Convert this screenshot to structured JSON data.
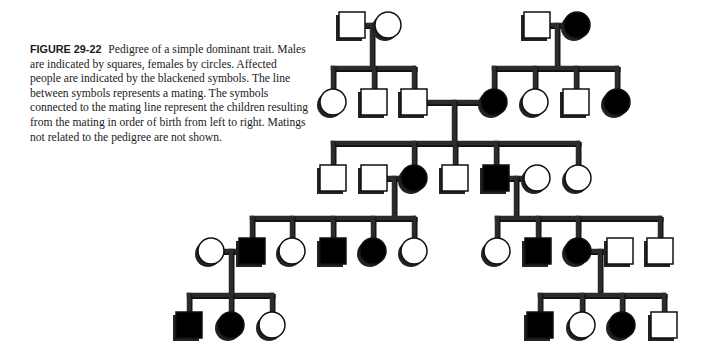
{
  "caption": {
    "label": "FIGURE 29-22",
    "text": "Pedigree of a simple dominant trait. Males are indicated by squares, females by circles. Affected people are indicated by the blackened symbols. The line between symbols represents a mating. The symbols connected to the mating line represent the children resulting from the mating in order of birth from left to right. Matings not related to the pedigree are not shown."
  },
  "legend_semantics": {
    "male": "square",
    "female": "circle",
    "affected": "filled black",
    "unaffected": "open white"
  },
  "colors": {
    "line": "#2b2b2b",
    "affected_fill": "#000000",
    "unaffected_fill": "#ffffff",
    "shadow": "#222222"
  },
  "pedigree": {
    "individuals": [
      {
        "id": "I1",
        "sex": "male",
        "affected": false,
        "x": 352,
        "y": 25
      },
      {
        "id": "I2",
        "sex": "female",
        "affected": false,
        "x": 388,
        "y": 25
      },
      {
        "id": "I3",
        "sex": "male",
        "affected": false,
        "x": 537,
        "y": 25
      },
      {
        "id": "I4",
        "sex": "female",
        "affected": true,
        "x": 577,
        "y": 25
      },
      {
        "id": "II1",
        "sex": "female",
        "affected": false,
        "x": 333,
        "y": 102
      },
      {
        "id": "II2",
        "sex": "male",
        "affected": false,
        "x": 374,
        "y": 102
      },
      {
        "id": "II3",
        "sex": "male",
        "affected": false,
        "x": 414,
        "y": 102
      },
      {
        "id": "II4",
        "sex": "female",
        "affected": true,
        "x": 494,
        "y": 102
      },
      {
        "id": "II5",
        "sex": "female",
        "affected": false,
        "x": 535,
        "y": 102
      },
      {
        "id": "II6",
        "sex": "male",
        "affected": false,
        "x": 576,
        "y": 102
      },
      {
        "id": "II7",
        "sex": "female",
        "affected": true,
        "x": 617,
        "y": 102
      },
      {
        "id": "III1",
        "sex": "male",
        "affected": false,
        "x": 333,
        "y": 178
      },
      {
        "id": "III2s",
        "sex": "male",
        "affected": false,
        "x": 374,
        "y": 178
      },
      {
        "id": "III2",
        "sex": "female",
        "affected": true,
        "x": 414,
        "y": 178
      },
      {
        "id": "III3",
        "sex": "male",
        "affected": false,
        "x": 455,
        "y": 178
      },
      {
        "id": "III4",
        "sex": "male",
        "affected": true,
        "x": 496,
        "y": 178
      },
      {
        "id": "III4s",
        "sex": "female",
        "affected": false,
        "x": 537,
        "y": 178
      },
      {
        "id": "III5",
        "sex": "female",
        "affected": false,
        "x": 578,
        "y": 178
      },
      {
        "id": "IV0s",
        "sex": "female",
        "affected": false,
        "x": 211,
        "y": 251
      },
      {
        "id": "IV1",
        "sex": "male",
        "affected": true,
        "x": 252,
        "y": 251
      },
      {
        "id": "IV2",
        "sex": "female",
        "affected": false,
        "x": 292,
        "y": 251
      },
      {
        "id": "IV3",
        "sex": "male",
        "affected": true,
        "x": 333,
        "y": 251
      },
      {
        "id": "IV4",
        "sex": "female",
        "affected": true,
        "x": 373,
        "y": 251
      },
      {
        "id": "IV5",
        "sex": "female",
        "affected": false,
        "x": 414,
        "y": 251
      },
      {
        "id": "IV6",
        "sex": "female",
        "affected": false,
        "x": 497,
        "y": 251
      },
      {
        "id": "IV7",
        "sex": "male",
        "affected": true,
        "x": 538,
        "y": 251
      },
      {
        "id": "IV8",
        "sex": "female",
        "affected": true,
        "x": 578,
        "y": 251
      },
      {
        "id": "IV8s",
        "sex": "male",
        "affected": false,
        "x": 620,
        "y": 251
      },
      {
        "id": "IV9",
        "sex": "male",
        "affected": false,
        "x": 660,
        "y": 251
      },
      {
        "id": "V1",
        "sex": "male",
        "affected": true,
        "x": 189,
        "y": 325
      },
      {
        "id": "V2",
        "sex": "female",
        "affected": true,
        "x": 231,
        "y": 325
      },
      {
        "id": "V3",
        "sex": "female",
        "affected": false,
        "x": 272,
        "y": 325
      },
      {
        "id": "V4",
        "sex": "male",
        "affected": true,
        "x": 540,
        "y": 325
      },
      {
        "id": "V5",
        "sex": "female",
        "affected": false,
        "x": 582,
        "y": 325
      },
      {
        "id": "V6",
        "sex": "female",
        "affected": true,
        "x": 622,
        "y": 325
      },
      {
        "id": "V7",
        "sex": "male",
        "affected": false,
        "x": 664,
        "y": 325
      }
    ],
    "matings": [
      {
        "a": "I1",
        "b": "I2",
        "drop_x": 372,
        "sib_y": 68,
        "children": [
          "II1",
          "II2",
          "II3"
        ]
      },
      {
        "a": "I3",
        "b": "I4",
        "drop_x": 557,
        "sib_y": 68,
        "children": [
          "II4",
          "II5",
          "II6",
          "II7"
        ]
      },
      {
        "a": "II3",
        "b": "II4",
        "drop_x": 454,
        "sib_y": 143,
        "children": [
          "III1",
          "III2",
          "III3",
          "III4",
          "III5"
        ]
      },
      {
        "a": "III2s",
        "b": "III2",
        "drop_x": 394,
        "sib_y": 218,
        "children": [
          "IV1",
          "IV2",
          "IV3",
          "IV4",
          "IV5"
        ]
      },
      {
        "a": "III4",
        "b": "III4s",
        "drop_x": 516,
        "sib_y": 218,
        "children": [
          "IV6",
          "IV7",
          "IV8",
          "IV9"
        ]
      },
      {
        "a": "IV0s",
        "b": "IV1",
        "drop_x": 231,
        "sib_y": 295,
        "children": [
          "V1",
          "V2",
          "V3"
        ]
      },
      {
        "a": "IV8",
        "b": "IV8s",
        "drop_x": 600,
        "sib_y": 295,
        "children": [
          "V4",
          "V5",
          "V6",
          "V7"
        ]
      }
    ]
  }
}
